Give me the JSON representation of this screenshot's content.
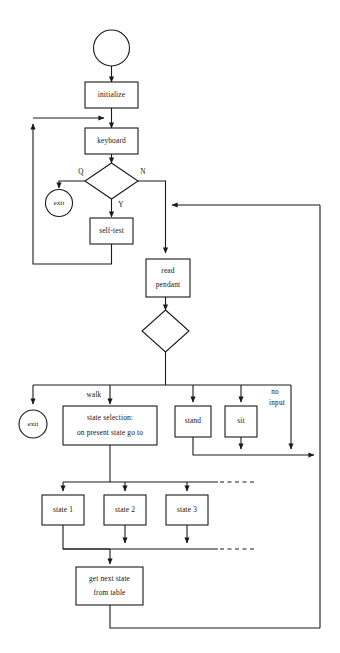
{
  "diagram": {
    "type": "flowchart",
    "title": "",
    "colors": {
      "stroke": "#1a1a1a",
      "fill": "#ffffff",
      "text": "#141414",
      "background": "#ffffff"
    },
    "nodes": {
      "start": {
        "label": "",
        "shape": "circle"
      },
      "initialize": {
        "label": "initialize",
        "shape": "process"
      },
      "keyboard": {
        "label": "keyboard",
        "shape": "process"
      },
      "decision_qny": {
        "label": "",
        "shape": "decision"
      },
      "exit_top": {
        "label": "exit",
        "shape": "circle"
      },
      "self_test": {
        "label": "self-test",
        "shape": "process"
      },
      "read_pendant": {
        "label_line1": "read",
        "label_line2": "pendant",
        "shape": "process"
      },
      "decision_pendant": {
        "label": "",
        "shape": "decision"
      },
      "exit_bottom": {
        "label": "exit",
        "shape": "circle"
      },
      "state_selection": {
        "label_line1": "state selection:",
        "label_line2": "on present  state go to",
        "shape": "process"
      },
      "stand": {
        "label": "stand",
        "shape": "process"
      },
      "sit": {
        "label": "sit",
        "shape": "process"
      },
      "state_1": {
        "label": "state 1",
        "shape": "process"
      },
      "state_2": {
        "label": "state 2",
        "shape": "process"
      },
      "state_3": {
        "label": "state 3",
        "shape": "process"
      },
      "get_next_state": {
        "label_line1": "get next state",
        "label_line2": "from table",
        "shape": "process"
      }
    },
    "edge_labels": {
      "q": "Q",
      "n": "N",
      "y": "Y",
      "walk": "walk",
      "no_input_line1": "no",
      "no_input_line2": "input"
    }
  }
}
